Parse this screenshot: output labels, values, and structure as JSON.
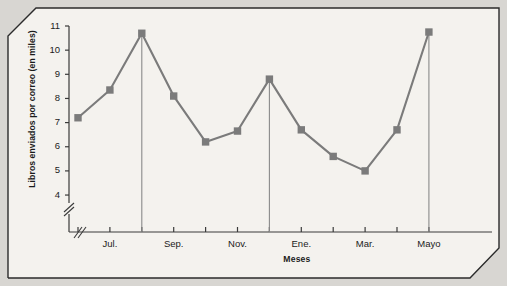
{
  "chart_data": {
    "type": "line",
    "title": "",
    "subtitle": "",
    "xlabel": "Meses",
    "ylabel": "Libros enviados por correo (en miles)",
    "x_tick_labels": [
      "Jul.",
      "Sep.",
      "Nov.",
      "Ene.",
      "Mar.",
      "Mayo"
    ],
    "x_tick_label_positions": [
      1,
      3,
      5,
      7,
      9,
      11
    ],
    "categories": [
      "Jul.",
      "Ago.",
      "Sep.",
      "Oct.",
      "Nov.",
      "Dic.",
      "Ene.",
      "Feb.",
      "Mar.",
      "Abr.",
      "Mayo",
      "Jun."
    ],
    "values": [
      7.2,
      8.35,
      10.7,
      8.1,
      6.2,
      6.65,
      8.8,
      6.7,
      5.6,
      5.0,
      6.7,
      10.75
    ],
    "y_tick_labels": [
      "4",
      "5",
      "6",
      "7",
      "8",
      "9",
      "10",
      "11"
    ],
    "y_tick_values": [
      4,
      5,
      6,
      7,
      8,
      9,
      10,
      11
    ],
    "ylim": [
      4,
      11
    ],
    "y_axis_broken": true,
    "x_axis_broken": true,
    "grid": false,
    "legend": null,
    "marker": "square",
    "series_color": "#7b7b7b",
    "axis_color": "#3a3a3a",
    "annotations": [
      {
        "type": "vertical-drop-line",
        "at_category": "Sep.",
        "note": "vertical line from peak to axis"
      },
      {
        "type": "vertical-drop-line",
        "at_category": "Ene.",
        "note": "vertical line from peak to axis"
      },
      {
        "type": "vertical-drop-line",
        "at_category": "Jun.",
        "note": "vertical line from peak to axis"
      }
    ]
  },
  "figure": {
    "background_color": "#d8d6d2",
    "panel_color": "#f4f2ee",
    "frame_color": "#2b2b2b"
  }
}
